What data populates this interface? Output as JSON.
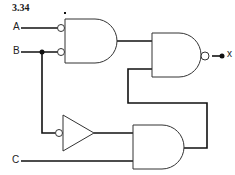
{
  "title": "3.34",
  "inputs": [
    {
      "label": "A",
      "y": 28
    },
    {
      "label": "B",
      "y": 52
    },
    {
      "label": "C",
      "y": 161
    }
  ],
  "output": {
    "label": "x"
  },
  "gates": [
    {
      "id": "g1",
      "type": "AND",
      "inverted_inputs": [
        "A",
        "B"
      ]
    },
    {
      "id": "g2",
      "type": "NAND",
      "inputs": [
        "g1",
        "g3"
      ]
    },
    {
      "id": "inv",
      "type": "NOT",
      "input": "B"
    },
    {
      "id": "g3",
      "type": "AND",
      "inputs": [
        "inv",
        "C"
      ]
    }
  ],
  "colors": {
    "stroke": "#111111",
    "background": "#ffffff"
  }
}
